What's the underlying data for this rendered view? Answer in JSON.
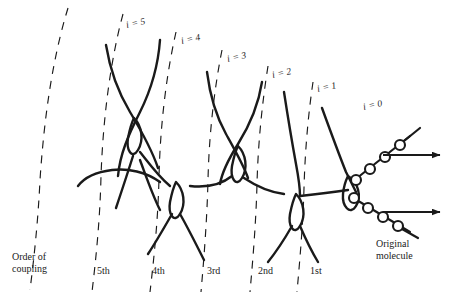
{
  "figure": {
    "background_color": "#ffffff",
    "ink_color": "#1a1a1a"
  },
  "generation_labels": [
    {
      "name": "gen-5",
      "text": "i = 5",
      "x": 126,
      "y": 18,
      "rotate": -12
    },
    {
      "name": "gen-4",
      "text": "i = 4",
      "x": 181,
      "y": 34,
      "rotate": -12
    },
    {
      "name": "gen-3",
      "text": "i = 3",
      "x": 227,
      "y": 52,
      "rotate": -12
    },
    {
      "name": "gen-2",
      "text": "i = 2",
      "x": 272,
      "y": 68,
      "rotate": -12
    },
    {
      "name": "gen-1",
      "text": "i = 1",
      "x": 317,
      "y": 82,
      "rotate": -12
    },
    {
      "name": "gen-0",
      "text": "i = 0",
      "x": 363,
      "y": 100,
      "rotate": -12
    }
  ],
  "order_labels": [
    {
      "name": "order-5th",
      "text": "5th",
      "x": 97,
      "y": 265
    },
    {
      "name": "order-4th",
      "text": "4th",
      "x": 152,
      "y": 265
    },
    {
      "name": "order-3rd",
      "text": "3rd",
      "x": 207,
      "y": 265
    },
    {
      "name": "order-2nd",
      "text": "2nd",
      "x": 258,
      "y": 265
    },
    {
      "name": "order-1st",
      "text": "1st",
      "x": 310,
      "y": 265
    }
  ],
  "axis_caption": {
    "line1": "Order of",
    "line2": "coupling",
    "x": 12,
    "y": 251
  },
  "molecule_caption": {
    "line1": "Original",
    "line2": "molecule",
    "x": 376,
    "y": 238
  },
  "chart_data": {
    "type": "diagram",
    "generations": [
      "i = 0",
      "i = 1",
      "i = 2",
      "i = 3",
      "i = 4",
      "i = 5"
    ],
    "coupling_orders": [
      "1st",
      "2nd",
      "3rd",
      "4th",
      "5th"
    ],
    "generation_count": 6,
    "branch_nodes": 5,
    "bead_chains": [
      {
        "name": "upper-chain",
        "bead_count": 4,
        "direction": "up-right",
        "arrow": true
      },
      {
        "name": "lower-chain",
        "bead_count": 4,
        "direction": "down-right",
        "arrow": true
      }
    ],
    "arrow_count": 2,
    "dashed_arc_count": 6,
    "legend": [
      "Order of coupling",
      "Original molecule"
    ]
  },
  "geometry": {
    "dashed_arcs": [
      {
        "name": "arc-5-outer",
        "d": "M 68 8 C 52 60 44 120 40 180 C 38 222 34 258 30 290"
      },
      {
        "name": "arc-5",
        "d": "M 123 14 C 110 62 103 120 101 176 C 100 220 96 258 92 292"
      },
      {
        "name": "arc-4",
        "d": "M 176 32 C 166 76 160 128 159 178 C 158 220 154 258 150 292"
      },
      {
        "name": "arc-3",
        "d": "M 222 50 C 214 90 209 136 208 180 C 207 220 204 258 201 292"
      },
      {
        "name": "arc-2",
        "d": "M 268 66 C 262 104 258 144 257 184 C 256 222 253 258 250 292"
      },
      {
        "name": "arc-1",
        "d": "M 313 82 C 308 116 305 152 304 188 C 303 224 300 258 297 292"
      }
    ],
    "strands": [
      {
        "name": "strand-gen5-a",
        "d": "M 106 45 C 110 70 118 92 130 112 C 142 132 152 150 158 168"
      },
      {
        "name": "strand-gen5-b",
        "d": "M 160 40 C 158 68 150 92 140 112 C 128 136 120 154 118 176"
      },
      {
        "name": "strand-gen5-loop",
        "d": "M 134 118 C 142 126 144 140 138 150 C 132 160 126 150 128 138 C 130 128 132 122 134 118 Z"
      },
      {
        "name": "strand-5-to-4-up",
        "d": "M 140 152 C 148 162 158 176 170 186"
      },
      {
        "name": "strand-5-to-4-dn",
        "d": "M 133 156 C 128 172 122 190 116 208"
      },
      {
        "name": "strand-gen4-tail-a",
        "d": "M 78 186 C 84 178 96 172 112 170 C 128 168 146 172 160 182"
      },
      {
        "name": "strand-gen4-tail-b",
        "d": "M 140 160 C 146 176 152 194 160 210"
      },
      {
        "name": "node4-loop",
        "d": "M 176 182 C 184 190 186 204 180 214 C 174 224 168 214 170 202 C 172 192 174 186 176 182 Z"
      },
      {
        "name": "strand-node4-dn-left",
        "d": "M 172 214 C 164 228 156 242 148 254"
      },
      {
        "name": "strand-node4-dn-right",
        "d": "M 180 214 C 188 228 196 244 204 260"
      },
      {
        "name": "strand-gen3-a",
        "d": "M 207 72 C 210 96 216 116 226 134 C 236 152 244 166 248 178"
      },
      {
        "name": "strand-gen3-b",
        "d": "M 262 82 C 258 108 248 128 238 144 C 228 160 222 172 220 184"
      },
      {
        "name": "node3-loop",
        "d": "M 238 146 C 246 154 248 168 242 178 C 236 188 230 178 232 166 C 234 156 236 150 238 146 Z"
      },
      {
        "name": "strand-3-to-2-right",
        "d": "M 244 178 C 256 186 268 192 284 194"
      },
      {
        "name": "strand-3-to-2-left",
        "d": "M 232 176 C 222 184 208 188 190 186"
      },
      {
        "name": "strand-gen2-a",
        "d": "M 284 92 C 288 118 292 142 296 164 C 299 180 300 190 300 196"
      },
      {
        "name": "node2-loop",
        "d": "M 296 194 C 304 202 306 216 300 226 C 294 236 288 226 290 214 C 292 204 294 198 296 194 Z"
      },
      {
        "name": "strand-node2-dn-left",
        "d": "M 292 226 C 284 240 276 252 268 262"
      },
      {
        "name": "strand-node2-dn-right",
        "d": "M 300 226 C 306 240 312 252 318 262"
      },
      {
        "name": "strand-trunk",
        "d": "M 300 196 C 318 194 334 192 348 190"
      },
      {
        "name": "strand-gen1-up",
        "d": "M 322 108 C 330 130 338 152 346 172 C 351 182 354 188 356 192"
      },
      {
        "name": "node0-loop",
        "d": "M 348 176 C 358 182 362 196 356 206 C 350 216 342 206 343 194 C 344 184 346 180 348 176 Z"
      }
    ],
    "bead_chains": [
      {
        "name": "upper-bead-chain",
        "path": "M 352 182 L 410 136",
        "beads": [
          {
            "cx": 356,
            "cy": 180,
            "r": 5
          },
          {
            "cx": 370,
            "cy": 169,
            "r": 5
          },
          {
            "cx": 385,
            "cy": 157,
            "r": 5
          },
          {
            "cx": 400,
            "cy": 145,
            "r": 5
          }
        ],
        "tail": "M 404 141 L 420 128"
      },
      {
        "name": "lower-bead-chain",
        "path": "M 350 196 L 410 232",
        "beads": [
          {
            "cx": 354,
            "cy": 198,
            "r": 5
          },
          {
            "cx": 368,
            "cy": 208,
            "r": 5
          },
          {
            "cx": 383,
            "cy": 217,
            "r": 5
          },
          {
            "cx": 398,
            "cy": 226,
            "r": 5
          }
        ],
        "tail": "M 402 229 L 418 238"
      }
    ],
    "arrows": [
      {
        "name": "arrow-upper",
        "x1": 383,
        "y1": 155,
        "x2": 440,
        "y2": 155
      },
      {
        "name": "arrow-lower",
        "x1": 383,
        "y1": 212,
        "x2": 440,
        "y2": 212
      }
    ]
  }
}
